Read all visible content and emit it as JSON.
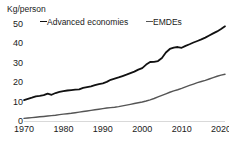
{
  "chart_data": {
    "type": "line",
    "title": "",
    "subtitle": "",
    "xlabel": "",
    "ylabel": "Kg/person",
    "unit_label": "Kg/person",
    "xlim": [
      1970,
      2021
    ],
    "ylim": [
      0,
      52
    ],
    "yticks": [
      0,
      10,
      20,
      30,
      40,
      50
    ],
    "ytick_labels": [
      "0",
      "10",
      "20",
      "30",
      "40",
      "50"
    ],
    "xticks": [
      1970,
      1980,
      1990,
      2000,
      2010,
      2020
    ],
    "xtick_labels": [
      "1970",
      "1980",
      "1990",
      "2000",
      "2010",
      "2020"
    ],
    "grid": false,
    "legend_position": "top",
    "x": [
      1970,
      1971,
      1972,
      1973,
      1974,
      1975,
      1976,
      1977,
      1978,
      1979,
      1980,
      1981,
      1982,
      1983,
      1984,
      1985,
      1986,
      1987,
      1988,
      1989,
      1990,
      1991,
      1992,
      1993,
      1994,
      1995,
      1996,
      1997,
      1998,
      1999,
      2000,
      2001,
      2002,
      2003,
      2004,
      2005,
      2006,
      2007,
      2008,
      2009,
      2010,
      2011,
      2012,
      2013,
      2014,
      2015,
      2016,
      2017,
      2018,
      2019,
      2020,
      2021
    ],
    "series": [
      {
        "name": "Advanced economies",
        "color": "#111111",
        "values": [
          11.0,
          11.6,
          12.2,
          12.9,
          13.1,
          13.5,
          14.3,
          13.7,
          14.6,
          15.2,
          15.6,
          15.9,
          16.1,
          16.3,
          16.5,
          17.2,
          17.6,
          18.0,
          18.6,
          19.2,
          19.6,
          20.3,
          21.4,
          22.0,
          22.6,
          23.3,
          24.0,
          24.8,
          25.6,
          26.6,
          27.4,
          29.2,
          30.5,
          30.6,
          31.0,
          32.6,
          35.4,
          37.2,
          37.9,
          38.2,
          37.8,
          38.8,
          39.6,
          40.5,
          41.3,
          42.1,
          43.0,
          44.1,
          45.2,
          46.2,
          47.4,
          48.8
        ]
      },
      {
        "name": "EMDEs",
        "color": "#555555",
        "values": [
          1.6,
          1.8,
          2.0,
          2.2,
          2.4,
          2.6,
          2.8,
          3.0,
          3.2,
          3.5,
          3.8,
          4.0,
          4.2,
          4.5,
          4.8,
          5.1,
          5.4,
          5.7,
          6.0,
          6.3,
          6.6,
          6.9,
          7.1,
          7.3,
          7.6,
          8.0,
          8.4,
          8.8,
          9.2,
          9.6,
          10.0,
          10.5,
          11.1,
          11.8,
          12.6,
          13.4,
          14.2,
          15.0,
          15.7,
          16.3,
          17.0,
          17.8,
          18.5,
          19.2,
          19.9,
          20.5,
          21.1,
          21.8,
          22.5,
          23.2,
          23.8,
          24.2
        ]
      }
    ]
  },
  "legend": {
    "entries": [
      {
        "label": "Advanced economies"
      },
      {
        "label": "EMDEs"
      }
    ]
  }
}
